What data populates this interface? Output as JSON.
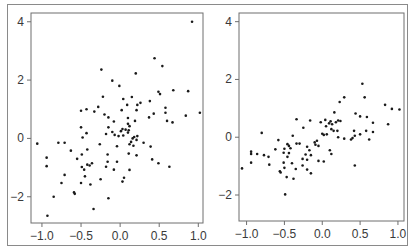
{
  "chart_data": [
    {
      "type": "scatter",
      "title": "",
      "xlabel": "",
      "ylabel": "",
      "xlim": [
        -1.14,
        1.06
      ],
      "ylim": [
        -2.9,
        4.3
      ],
      "xticks": [
        -1.0,
        -0.5,
        0.0,
        0.5,
        1.0
      ],
      "xtick_labels": [
        "−1.0",
        "−0.5",
        "0.0",
        "0.5",
        "1.0"
      ],
      "yticks": [
        4,
        2,
        0,
        -2
      ],
      "ytick_labels": [
        "4",
        "2",
        "0",
        "−2"
      ],
      "grid": false,
      "legend": null,
      "box": {
        "left": 31,
        "top": 13,
        "right": 203,
        "bottom": 223
      },
      "points": [
        [
          0.92,
          4.0
        ],
        [
          0.44,
          2.75
        ],
        [
          0.54,
          2.48
        ],
        [
          -0.24,
          2.36
        ],
        [
          0.2,
          2.23
        ],
        [
          -0.1,
          1.98
        ],
        [
          -0.01,
          1.8
        ],
        [
          0.49,
          1.6
        ],
        [
          0.51,
          1.52
        ],
        [
          0.68,
          1.65
        ],
        [
          0.87,
          1.62
        ],
        [
          -0.22,
          1.43
        ],
        [
          0.15,
          1.42
        ],
        [
          0.04,
          1.35
        ],
        [
          0.38,
          1.28
        ],
        [
          0.26,
          1.22
        ],
        [
          0.22,
          1.15
        ],
        [
          0.09,
          1.15
        ],
        [
          -0.28,
          1.08
        ],
        [
          0.58,
          1.05
        ],
        [
          -0.43,
          1.0
        ],
        [
          0.02,
          0.97
        ],
        [
          -0.5,
          0.95
        ],
        [
          0.21,
          0.97
        ],
        [
          -0.33,
          0.92
        ],
        [
          0.58,
          0.88
        ],
        [
          1.02,
          0.88
        ],
        [
          0.43,
          0.85
        ],
        [
          -0.2,
          0.82
        ],
        [
          0.84,
          0.78
        ],
        [
          0.37,
          0.72
        ],
        [
          -0.15,
          0.72
        ],
        [
          0.1,
          0.7
        ],
        [
          0.6,
          0.6
        ],
        [
          -0.08,
          0.58
        ],
        [
          0.19,
          0.6
        ],
        [
          0.67,
          0.55
        ],
        [
          0.1,
          0.5
        ],
        [
          0.12,
          0.42
        ],
        [
          -0.5,
          0.38
        ],
        [
          -0.15,
          0.38
        ],
        [
          0.03,
          0.32
        ],
        [
          0.07,
          0.3
        ],
        [
          0.11,
          0.28
        ],
        [
          0.01,
          0.25
        ],
        [
          -0.1,
          0.22
        ],
        [
          0.1,
          0.2
        ],
        [
          -0.43,
          0.18
        ],
        [
          -0.18,
          0.15
        ],
        [
          -0.07,
          0.12
        ],
        [
          0.22,
          0.08
        ],
        [
          -0.02,
          0.08
        ],
        [
          0.04,
          0.1
        ],
        [
          0.18,
          0.05
        ],
        [
          -0.48,
          0.03
        ],
        [
          0.16,
          0.0
        ],
        [
          0.21,
          -0.05
        ],
        [
          0.14,
          -0.12
        ],
        [
          -1.06,
          -0.18
        ],
        [
          -0.79,
          -0.15
        ],
        [
          -0.71,
          -0.15
        ],
        [
          0.3,
          -0.15
        ],
        [
          -0.26,
          -0.2
        ],
        [
          0.12,
          -0.2
        ],
        [
          0.17,
          -0.25
        ],
        [
          -0.04,
          -0.27
        ],
        [
          0.39,
          -0.28
        ],
        [
          -0.42,
          -0.38
        ],
        [
          -0.63,
          -0.42
        ],
        [
          0.11,
          -0.52
        ],
        [
          -0.16,
          -0.55
        ],
        [
          -0.49,
          -0.55
        ],
        [
          0.21,
          -0.58
        ],
        [
          -0.94,
          -0.66
        ],
        [
          -0.55,
          -0.7
        ],
        [
          0.41,
          -0.72
        ],
        [
          -0.04,
          -0.8
        ],
        [
          -0.16,
          -0.8
        ],
        [
          -0.36,
          -0.85
        ],
        [
          0.49,
          -0.85
        ],
        [
          -0.42,
          -0.9
        ],
        [
          -0.39,
          -0.93
        ],
        [
          -0.94,
          -0.95
        ],
        [
          -0.49,
          -0.98
        ],
        [
          -0.18,
          -0.97
        ],
        [
          0.63,
          -0.97
        ],
        [
          -0.08,
          -1.07
        ],
        [
          -0.46,
          -1.07
        ],
        [
          0.12,
          -1.08
        ],
        [
          -0.71,
          -1.25
        ],
        [
          -0.45,
          -1.3
        ],
        [
          0.05,
          -1.35
        ],
        [
          -0.25,
          -1.4
        ],
        [
          0.03,
          -1.48
        ],
        [
          -0.75,
          -1.53
        ],
        [
          -0.5,
          -1.53
        ],
        [
          -0.38,
          -1.58
        ],
        [
          -0.59,
          -1.85
        ],
        [
          -0.58,
          -1.9
        ],
        [
          -0.85,
          -2.0
        ],
        [
          -0.15,
          -2.05
        ],
        [
          -0.34,
          -2.42
        ],
        [
          -0.93,
          -2.65
        ]
      ]
    },
    {
      "type": "scatter",
      "title": "",
      "xlabel": "",
      "ylabel": "",
      "xlim": [
        -1.1,
        1.08
      ],
      "ylim": [
        -2.9,
        4.3
      ],
      "xticks": [
        -1.0,
        -0.5,
        0.0,
        0.5,
        1.0
      ],
      "xtick_labels": [
        "−1.0",
        "−0.5",
        "0.0",
        "0.5",
        "1.0"
      ],
      "yticks": [
        4,
        2,
        0,
        -2
      ],
      "ytick_labels": [
        "4",
        "2",
        "0",
        "−2"
      ],
      "grid": false,
      "legend": null,
      "box": {
        "left": 239,
        "top": 13,
        "right": 404,
        "bottom": 221
      },
      "points": [
        [
          0.53,
          1.85
        ],
        [
          0.56,
          1.38
        ],
        [
          0.29,
          1.38
        ],
        [
          0.23,
          1.22
        ],
        [
          0.83,
          1.12
        ],
        [
          0.92,
          0.98
        ],
        [
          1.02,
          0.96
        ],
        [
          0.44,
          0.82
        ],
        [
          0.16,
          0.86
        ],
        [
          0.5,
          0.72
        ],
        [
          0.59,
          0.7
        ],
        [
          -0.34,
          0.62
        ],
        [
          -0.16,
          0.58
        ],
        [
          0.04,
          0.6
        ],
        [
          0.11,
          0.55
        ],
        [
          0.21,
          0.58
        ],
        [
          0.24,
          0.56
        ],
        [
          0.18,
          0.52
        ],
        [
          -0.02,
          0.52
        ],
        [
          0.09,
          0.48
        ],
        [
          0.67,
          0.5
        ],
        [
          0.13,
          0.45
        ],
        [
          0.87,
          0.45
        ],
        [
          0.05,
          0.38
        ],
        [
          -0.25,
          0.33
        ],
        [
          0.12,
          0.28
        ],
        [
          0.2,
          0.22
        ],
        [
          0.42,
          0.22
        ],
        [
          0.58,
          0.22
        ],
        [
          0.67,
          0.18
        ],
        [
          0.15,
          0.22
        ],
        [
          -0.8,
          0.15
        ],
        [
          0.0,
          0.12
        ],
        [
          0.06,
          0.1
        ],
        [
          0.02,
          0.08
        ],
        [
          0.5,
          0.1
        ],
        [
          0.43,
          0.05
        ],
        [
          -0.39,
          0.05
        ],
        [
          0.21,
          0.0
        ],
        [
          0.29,
          -0.05
        ],
        [
          0.4,
          -0.03
        ],
        [
          0.38,
          -0.08
        ],
        [
          0.62,
          -0.08
        ],
        [
          -0.58,
          -0.1
        ],
        [
          -0.07,
          -0.12
        ],
        [
          -0.1,
          -0.18
        ],
        [
          -0.3,
          -0.22
        ],
        [
          -0.46,
          -0.24
        ],
        [
          -0.34,
          -0.22
        ],
        [
          -0.09,
          -0.26
        ],
        [
          -0.44,
          -0.3
        ],
        [
          -0.05,
          -0.3
        ],
        [
          -0.2,
          -0.33
        ],
        [
          -0.42,
          -0.38
        ],
        [
          -0.5,
          -0.4
        ],
        [
          -0.62,
          -0.42
        ],
        [
          -0.17,
          -0.45
        ],
        [
          -0.94,
          -0.5
        ],
        [
          0.1,
          -0.45
        ],
        [
          -0.94,
          -0.58
        ],
        [
          -0.51,
          -0.54
        ],
        [
          -0.44,
          -0.55
        ],
        [
          -0.86,
          -0.58
        ],
        [
          0.12,
          -0.58
        ],
        [
          -0.77,
          -0.62
        ],
        [
          -0.22,
          -0.6
        ],
        [
          -0.15,
          -0.62
        ],
        [
          -0.71,
          -0.68
        ],
        [
          -0.46,
          -0.68
        ],
        [
          -0.26,
          -0.75
        ],
        [
          -0.2,
          -0.78
        ],
        [
          -0.05,
          -0.82
        ],
        [
          0.02,
          -0.84
        ],
        [
          -0.94,
          -0.88
        ],
        [
          -0.51,
          -0.88
        ],
        [
          -0.4,
          -0.9
        ],
        [
          -0.26,
          -0.98
        ],
        [
          -0.7,
          -0.95
        ],
        [
          0.43,
          -0.98
        ],
        [
          -0.5,
          -1.06
        ],
        [
          -1.06,
          -1.08
        ],
        [
          -0.35,
          -1.1
        ],
        [
          -0.2,
          -1.12
        ],
        [
          -0.56,
          -1.18
        ],
        [
          -0.55,
          -1.22
        ],
        [
          -0.15,
          -1.25
        ],
        [
          -0.47,
          -1.38
        ],
        [
          -0.38,
          -1.44
        ],
        [
          -0.49,
          -1.98
        ]
      ]
    }
  ]
}
